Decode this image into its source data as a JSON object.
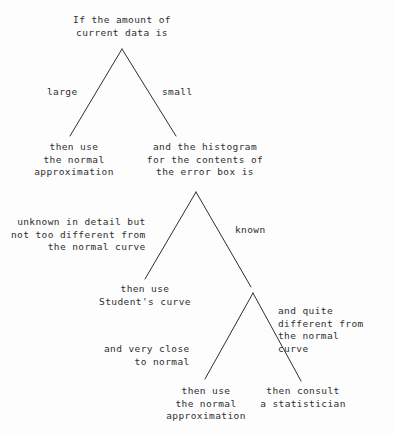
{
  "diagram": {
    "type": "decision-tree",
    "background_color": "#fdfdfd",
    "ink_color": "#2e2e2e",
    "nodes": [
      {
        "id": "root",
        "text": "If the amount of\ncurrent data is",
        "x": 122,
        "y": 14
      },
      {
        "id": "normal-approx-large",
        "text": "then use\nthe normal\napproximation",
        "x": 74,
        "y": 141
      },
      {
        "id": "histogram-question",
        "text": "and the histogram\nfor the contents of\nthe error box is",
        "x": 205,
        "y": 141
      },
      {
        "id": "students-curve",
        "text": "then use\nStudent's curve",
        "x": 145,
        "y": 283
      },
      {
        "id": "normal-approx-close",
        "text": "then use\nthe normal\napproximation",
        "x": 206,
        "y": 385
      },
      {
        "id": "consult-statistician",
        "text": "then consult\na statistician",
        "x": 303,
        "y": 385
      }
    ],
    "edge_labels": [
      {
        "id": "large",
        "text": "large",
        "x": 47,
        "y": 86,
        "align": "lbl-left"
      },
      {
        "id": "small",
        "text": "small",
        "x": 162,
        "y": 86,
        "align": "lbl-right"
      },
      {
        "id": "unknown-detail",
        "text": "unknown in detail but\nnot too different from\nthe normal curve",
        "x": 11,
        "y": 216,
        "align": "lbl-left"
      },
      {
        "id": "known",
        "text": "known",
        "x": 235,
        "y": 224,
        "align": "lbl-right"
      },
      {
        "id": "very-close",
        "text": "and very close\nto normal",
        "x": 104,
        "y": 343,
        "align": "lbl-left"
      },
      {
        "id": "quite-different",
        "text": "and quite\ndifferent from\nthe normal\ncurve",
        "x": 278,
        "y": 305,
        "align": "lbl-right"
      }
    ],
    "edges": [
      {
        "id": "root-to-large",
        "x1": 122,
        "y1": 49,
        "x2": 70,
        "y2": 136
      },
      {
        "id": "root-to-small",
        "x1": 122,
        "y1": 49,
        "x2": 176,
        "y2": 136
      },
      {
        "id": "histogram-to-unknown",
        "x1": 196,
        "y1": 192,
        "x2": 145,
        "y2": 279
      },
      {
        "id": "histogram-to-known",
        "x1": 196,
        "y1": 192,
        "x2": 251,
        "y2": 287
      },
      {
        "id": "known-to-very-close",
        "x1": 253,
        "y1": 293,
        "x2": 205,
        "y2": 379
      },
      {
        "id": "known-to-quite-different",
        "x1": 253,
        "y1": 293,
        "x2": 301,
        "y2": 381
      }
    ]
  }
}
